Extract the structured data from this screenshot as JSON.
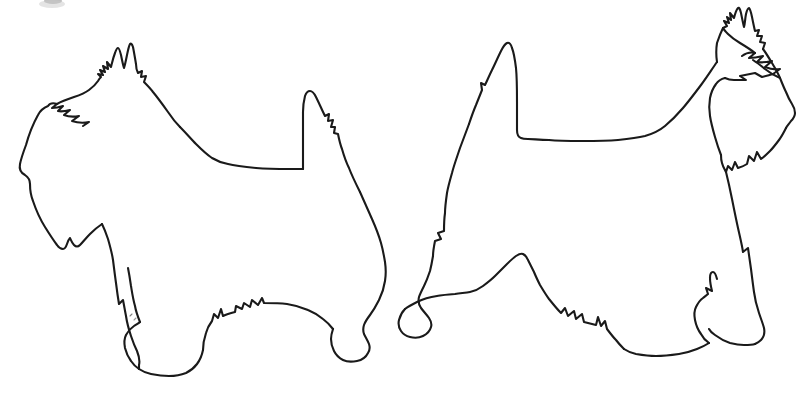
{
  "image": {
    "title": "Two Scottish Terriers line drawing",
    "description": "Black outline drawing of two Scottish Terrier dogs standing in profile, both facing left, on a plain white background.",
    "width": 810,
    "height": 403,
    "style": "line-art-outline",
    "background_color": "#ffffff",
    "stroke_color": "#1a1a1a",
    "stroke_width": 2.1
  },
  "subjects": [
    {
      "id": "dog-left",
      "name": "Scottish Terrier (left)",
      "facing": "left",
      "bounding_box": {
        "x": 18,
        "y": 42,
        "width": 372,
        "height": 345
      },
      "parts": [
        "pointed-left-ear",
        "pointed-right-ear",
        "bearded-muzzle",
        "eyebrow-tuft",
        "neck",
        "level-back",
        "upright-tail",
        "foreleg-front",
        "foreleg-rear",
        "hind-leg",
        "skirt-furnishings",
        "paws"
      ]
    },
    {
      "id": "dog-right",
      "name": "Scottish Terrier (right)",
      "facing": "left",
      "bounding_box": {
        "x": 405,
        "y": 8,
        "width": 392,
        "height": 352
      },
      "parts": [
        "pointed-left-ear",
        "pointed-right-ear",
        "bearded-muzzle",
        "eyebrow-tuft",
        "neck",
        "level-back",
        "upright-tail",
        "foreleg-front",
        "foreleg-rear",
        "hind-leg",
        "skirt-furnishings",
        "paws"
      ]
    }
  ],
  "artifacts": [
    {
      "id": "top-edge-smudge",
      "name": "Faint ink smudge clipped by top edge",
      "x": 40,
      "y": 0,
      "width": 26,
      "height": 7,
      "color": "#8b8b8b"
    }
  ]
}
